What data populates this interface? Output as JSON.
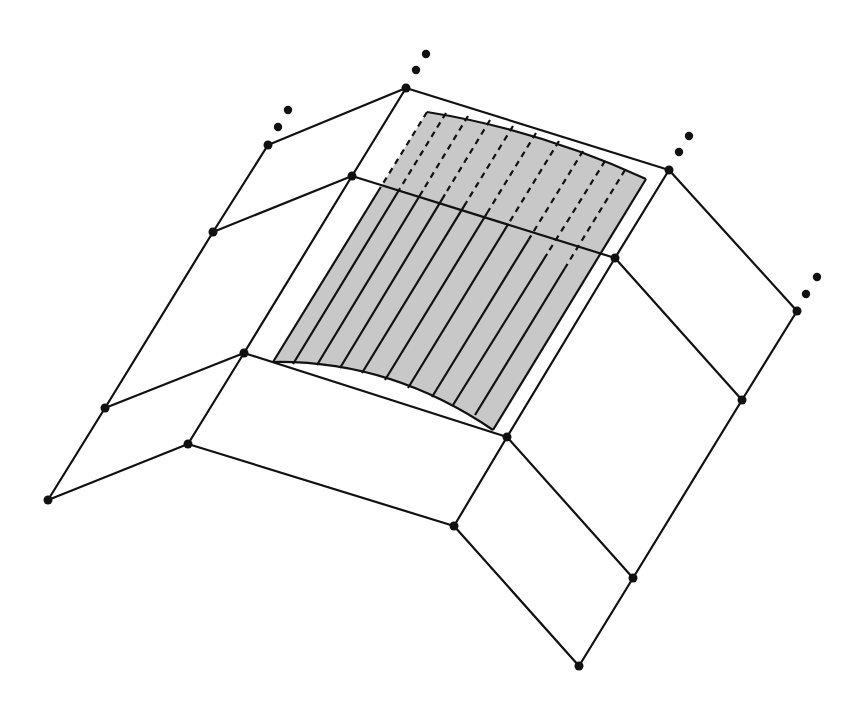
{
  "diagram": {
    "title": "",
    "colors": {
      "background": "#ffffff",
      "line": "#111111",
      "vertex": "#111111",
      "patch_fill": "#c8c8c8"
    },
    "line_width": 2.2,
    "vertex_radius": 4.5,
    "ellipsis_dot_radius": 4.2,
    "mesh_columns": [
      [
        [
          268,
          145
        ],
        [
          213,
          232
        ],
        [
          105,
          408
        ],
        [
          48,
          500
        ]
      ],
      [
        [
          406,
          88
        ],
        [
          352,
          176
        ],
        [
          244,
          353
        ],
        [
          188,
          444
        ]
      ],
      [
        [
          669,
          170
        ],
        [
          615,
          258
        ],
        [
          507,
          437
        ],
        [
          454,
          526
        ]
      ],
      [
        [
          797,
          311
        ],
        [
          742,
          400
        ],
        [
          633,
          578
        ],
        [
          579,
          666
        ]
      ]
    ],
    "continuation_ellipses": [
      {
        "vertex": [
          268,
          145
        ],
        "dots": [
          [
            278,
            127
          ],
          [
            288,
            110
          ]
        ]
      },
      {
        "vertex": [
          406,
          88
        ],
        "dots": [
          [
            416,
            70
          ],
          [
            426,
            54
          ]
        ]
      },
      {
        "vertex": [
          669,
          170
        ],
        "dots": [
          [
            679,
            152
          ],
          [
            689,
            136
          ]
        ]
      },
      {
        "vertex": [
          797,
          311
        ],
        "dots": [
          [
            806,
            294
          ],
          [
            817,
            277
          ]
        ]
      }
    ],
    "patch": {
      "corners": {
        "top_left": [
          427,
          112
        ],
        "top_right": [
          646,
          179
        ],
        "bottom_right": [
          493,
          430
        ],
        "bottom_left": [
          273,
          362
        ]
      },
      "top_edge_control": [
        540,
        130
      ],
      "bottom_edge_control": [
        390,
        360
      ],
      "stripe_count": 9,
      "stripes": [
        {
          "top": [
            446,
            113
          ],
          "bottom": [
            293,
            364
          ],
          "dash_until_t": 0.3
        },
        {
          "top": [
            468,
            116
          ],
          "bottom": [
            317,
            365
          ],
          "dash_until_t": 0.3
        },
        {
          "top": [
            490,
            120
          ],
          "bottom": [
            340,
            368
          ],
          "dash_until_t": 0.3
        },
        {
          "top": [
            513,
            126
          ],
          "bottom": [
            362,
            373
          ],
          "dash_until_t": 0.31
        },
        {
          "top": [
            536,
            133
          ],
          "bottom": [
            385,
            380
          ],
          "dash_until_t": 0.32
        },
        {
          "top": [
            559,
            141
          ],
          "bottom": [
            408,
            388
          ],
          "dash_until_t": 0.34
        },
        {
          "top": [
            583,
            151
          ],
          "bottom": [
            432,
            397
          ],
          "dash_until_t": 0.36
        },
        {
          "top": [
            605,
            161
          ],
          "bottom": [
            453,
            405
          ],
          "dash_until_t": 0.38
        },
        {
          "top": [
            625,
            170
          ],
          "bottom": [
            475,
            415
          ],
          "dash_until_t": 0.4
        }
      ],
      "left_edge_dash_until_t": 0.3
    }
  }
}
